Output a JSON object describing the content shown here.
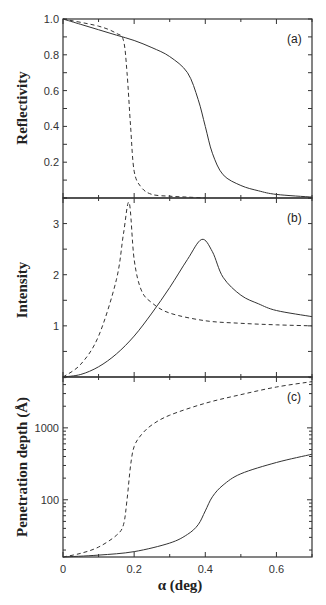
{
  "chart_data": [
    {
      "type": "line",
      "panel": "(a)",
      "ylabel": "Reflectivity",
      "xlabel": "",
      "xlim": [
        0,
        0.7
      ],
      "ylim": [
        0,
        1.0
      ],
      "yticks": [
        "0.2",
        "0.4",
        "0.6",
        "0.8",
        "1.0"
      ],
      "grid": false,
      "series": [
        {
          "name": "solid",
          "style": "solid",
          "x": [
            0,
            0.05,
            0.1,
            0.15,
            0.2,
            0.25,
            0.3,
            0.35,
            0.38,
            0.4,
            0.42,
            0.45,
            0.5,
            0.55,
            0.6,
            0.7
          ],
          "y": [
            1.0,
            0.97,
            0.94,
            0.91,
            0.88,
            0.84,
            0.79,
            0.7,
            0.55,
            0.4,
            0.25,
            0.13,
            0.07,
            0.04,
            0.02,
            0.005
          ]
        },
        {
          "name": "dashed",
          "style": "dashed",
          "x": [
            0,
            0.1,
            0.15,
            0.17,
            0.18,
            0.19,
            0.2,
            0.22,
            0.25,
            0.3,
            0.35,
            0.4
          ],
          "y": [
            1.0,
            0.96,
            0.92,
            0.88,
            0.7,
            0.4,
            0.15,
            0.06,
            0.02,
            0.01,
            0.005,
            0.0
          ]
        }
      ]
    },
    {
      "type": "line",
      "panel": "(b)",
      "ylabel": "Intensity",
      "xlabel": "",
      "xlim": [
        0,
        0.7
      ],
      "ylim": [
        0,
        3.5
      ],
      "yticks": [
        "1",
        "2",
        "3"
      ],
      "grid": false,
      "series": [
        {
          "name": "solid",
          "style": "solid",
          "x": [
            0,
            0.05,
            0.1,
            0.15,
            0.2,
            0.25,
            0.3,
            0.35,
            0.39,
            0.42,
            0.45,
            0.5,
            0.55,
            0.6,
            0.7
          ],
          "y": [
            0.0,
            0.05,
            0.2,
            0.45,
            0.8,
            1.25,
            1.75,
            2.3,
            2.69,
            2.45,
            1.95,
            1.6,
            1.43,
            1.3,
            1.18
          ]
        },
        {
          "name": "dashed",
          "style": "dashed",
          "x": [
            0,
            0.05,
            0.1,
            0.15,
            0.17,
            0.186,
            0.2,
            0.22,
            0.25,
            0.3,
            0.4,
            0.5,
            0.6,
            0.7
          ],
          "y": [
            0.0,
            0.25,
            0.8,
            1.9,
            2.8,
            3.41,
            2.3,
            1.7,
            1.45,
            1.25,
            1.1,
            1.05,
            1.02,
            1.0
          ]
        }
      ]
    },
    {
      "type": "line",
      "panel": "(c)",
      "ylabel": "Penetration depth (Å)",
      "xlabel": "α (deg)",
      "xlim": [
        0,
        0.7
      ],
      "ylim": [
        16,
        5100
      ],
      "yscale": "log",
      "yticks": [
        "100",
        "1000"
      ],
      "xticks": [
        "0",
        "0.2",
        "0.4",
        "0.6"
      ],
      "grid": false,
      "series": [
        {
          "name": "solid",
          "style": "solid",
          "x": [
            0,
            0.1,
            0.2,
            0.3,
            0.35,
            0.38,
            0.4,
            0.42,
            0.45,
            0.5,
            0.6,
            0.7
          ],
          "y": [
            16,
            17,
            19,
            25,
            33,
            45,
            70,
            110,
            160,
            230,
            330,
            430
          ]
        },
        {
          "name": "dashed",
          "style": "dashed",
          "x": [
            0,
            0.05,
            0.1,
            0.15,
            0.17,
            0.18,
            0.19,
            0.2,
            0.22,
            0.25,
            0.3,
            0.4,
            0.5,
            0.6,
            0.7
          ],
          "y": [
            16,
            18,
            22,
            32,
            45,
            100,
            300,
            550,
            800,
            1100,
            1500,
            2200,
            2900,
            3700,
            4400
          ]
        }
      ]
    }
  ],
  "labels": {
    "panel_a": "(a)",
    "panel_b": "(b)",
    "panel_c": "(c)",
    "ylabel_a": "Reflectivity",
    "ylabel_b": "Intensity",
    "ylabel_c": "Penetration depth (Å)",
    "xlabel": "α (deg)"
  }
}
